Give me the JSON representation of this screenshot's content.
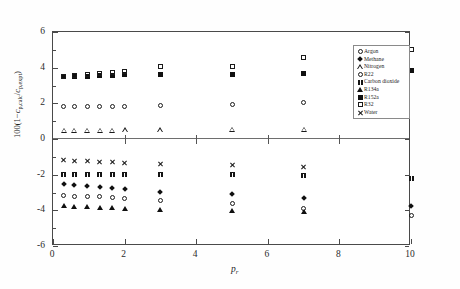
{
  "chart_data": {
    "type": "scatter",
    "title": "",
    "xlabel": "p r",
    "xlabel_main": "p",
    "xlabel_sub": "r",
    "ylabel": "100(1-c p,calc / c p,expt)",
    "ylabel_parts": {
      "lead": "100(1",
      "minus": "−",
      "c1": "c",
      "sub1": "p,calc",
      "slash": "/",
      "c2": "c",
      "sub2": "p,expt",
      "close": ")"
    },
    "xlim": [
      0,
      10
    ],
    "ylim": [
      -6,
      6
    ],
    "xticks": [
      0,
      2,
      4,
      6,
      8,
      10
    ],
    "yticks": [
      6,
      4,
      2,
      0,
      -2,
      -4,
      -6
    ],
    "xtick_labels": [
      "0",
      "2",
      "4",
      "6",
      "8",
      "10"
    ],
    "ytick_labels": [
      "6",
      "4",
      "2",
      "0",
      "-2",
      "-4",
      "-6"
    ],
    "grid": false,
    "zero_line": true,
    "legend_position": "upper-right-inside",
    "series": [
      {
        "name": "Argon",
        "marker": "open-circle",
        "marker_class": "m-ocircle",
        "points": [
          [
            0.3,
            -3.15
          ],
          [
            0.6,
            -3.2
          ],
          [
            0.95,
            -3.22
          ],
          [
            1.3,
            -3.25
          ],
          [
            1.65,
            -3.3
          ],
          [
            2.0,
            -3.35
          ],
          [
            3.0,
            -3.45
          ],
          [
            5.0,
            -3.6
          ],
          [
            7.0,
            -3.9
          ],
          [
            10.0,
            -4.3
          ]
        ]
      },
      {
        "name": "Methane",
        "marker": "filled-diamond",
        "marker_class": "m-fdiamond",
        "points": [
          [
            0.3,
            -2.55
          ],
          [
            0.6,
            -2.58
          ],
          [
            0.95,
            -2.62
          ],
          [
            1.3,
            -2.68
          ],
          [
            1.65,
            -2.75
          ],
          [
            2.0,
            -2.82
          ],
          [
            3.0,
            -2.95
          ],
          [
            5.0,
            -3.1
          ],
          [
            7.0,
            -3.3
          ],
          [
            10.0,
            -3.75
          ]
        ]
      },
      {
        "name": "Nitrogen",
        "marker": "open-triangle",
        "marker_class": "m-otriangle",
        "points": [
          [
            0.3,
            0.5
          ],
          [
            0.6,
            0.5
          ],
          [
            0.95,
            0.5
          ],
          [
            1.3,
            0.5
          ],
          [
            1.65,
            0.5
          ],
          [
            2.0,
            0.52
          ],
          [
            3.0,
            0.52
          ],
          [
            5.0,
            0.55
          ],
          [
            7.0,
            0.55
          ]
        ]
      },
      {
        "name": "R22",
        "marker": "open-circle",
        "marker_class": "m-ocircle2",
        "points": [
          [
            0.3,
            1.8
          ],
          [
            0.6,
            1.8
          ],
          [
            0.95,
            1.8
          ],
          [
            1.3,
            1.82
          ],
          [
            1.65,
            1.85
          ],
          [
            2.0,
            1.85
          ],
          [
            3.0,
            1.9
          ],
          [
            5.0,
            1.95
          ],
          [
            7.0,
            2.05
          ]
        ]
      },
      {
        "name": "Carbon dioxide",
        "marker": "filled-square-x",
        "marker_class": "m-xfill",
        "points": [
          [
            0.3,
            -2.0
          ],
          [
            0.6,
            -2.0
          ],
          [
            0.95,
            -2.0
          ],
          [
            1.3,
            -2.0
          ],
          [
            1.65,
            -2.0
          ],
          [
            2.0,
            -2.0
          ],
          [
            3.0,
            -2.0
          ],
          [
            5.0,
            -2.0
          ],
          [
            7.0,
            -2.05
          ],
          [
            10.0,
            -2.2
          ]
        ]
      },
      {
        "name": "R134a",
        "marker": "filled-triangle",
        "marker_class": "m-ftriangle",
        "points": [
          [
            0.3,
            -3.75
          ],
          [
            0.6,
            -3.78
          ],
          [
            0.95,
            -3.8
          ],
          [
            1.3,
            -3.82
          ],
          [
            1.65,
            -3.85
          ],
          [
            2.0,
            -3.88
          ],
          [
            3.0,
            -3.95
          ],
          [
            5.0,
            -4.0
          ],
          [
            7.0,
            -4.05
          ]
        ]
      },
      {
        "name": "R152a",
        "marker": "filled-square",
        "marker_class": "m-fsquare",
        "points": [
          [
            0.3,
            3.48
          ],
          [
            0.6,
            3.5
          ],
          [
            0.95,
            3.52
          ],
          [
            1.3,
            3.55
          ],
          [
            1.65,
            3.58
          ],
          [
            2.0,
            3.6
          ],
          [
            3.0,
            3.62
          ],
          [
            5.0,
            3.62
          ],
          [
            7.0,
            3.7
          ],
          [
            10.0,
            3.85
          ]
        ]
      },
      {
        "name": "R32",
        "marker": "open-square",
        "marker_class": "m-osquare",
        "points": [
          [
            0.3,
            3.5
          ],
          [
            0.6,
            3.55
          ],
          [
            0.95,
            3.62
          ],
          [
            1.3,
            3.68
          ],
          [
            1.65,
            3.72
          ],
          [
            2.0,
            3.78
          ],
          [
            3.0,
            4.05
          ],
          [
            5.0,
            4.05
          ],
          [
            7.0,
            4.55
          ],
          [
            10.0,
            5.0
          ]
        ]
      },
      {
        "name": "Water",
        "marker": "x-cross",
        "marker_class": "m-xcross",
        "points": [
          [
            0.3,
            -1.2
          ],
          [
            0.6,
            -1.22
          ],
          [
            0.95,
            -1.25
          ],
          [
            1.3,
            -1.28
          ],
          [
            1.65,
            -1.3
          ],
          [
            2.0,
            -1.32
          ],
          [
            3.0,
            -1.4
          ],
          [
            5.0,
            -1.45
          ],
          [
            7.0,
            -1.55
          ]
        ]
      }
    ]
  },
  "legend": {
    "items": [
      {
        "label": "Argon",
        "marker_class": "m-ocircle"
      },
      {
        "label": "Methane",
        "marker_class": "m-fdiamond"
      },
      {
        "label": "Nitrogen",
        "marker_class": "m-otriangle"
      },
      {
        "label": "R22",
        "marker_class": "m-ocircle2"
      },
      {
        "label": "Carbon dioxide",
        "marker_class": "m-xfill"
      },
      {
        "label": "R134a",
        "marker_class": "m-ftriangle"
      },
      {
        "label": "R152a",
        "marker_class": "m-fsquare"
      },
      {
        "label": "R32",
        "marker_class": "m-osquare"
      },
      {
        "label": "Water",
        "marker_class": "m-xcross"
      }
    ]
  }
}
